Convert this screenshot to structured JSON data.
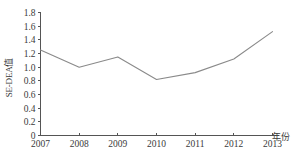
{
  "chart_data": {
    "type": "line",
    "title": "",
    "subtitle": "",
    "xlabel": "年份",
    "ylabel": "SE-DEA值",
    "x": [
      2007,
      2008,
      2009,
      2010,
      2011,
      2012,
      2013
    ],
    "categories": [
      "2007",
      "2008",
      "2009",
      "2010",
      "2011",
      "2012",
      "2013"
    ],
    "series": [
      {
        "name": "SE-DEA值",
        "values": [
          1.25,
          1.0,
          1.15,
          0.82,
          0.92,
          1.12,
          1.52
        ],
        "color": "#8a8a8a"
      }
    ],
    "xlim": [
      2007,
      2013
    ],
    "ylim": [
      0,
      1.8
    ],
    "ytick_labels": [
      "0",
      "0.2",
      "0.4",
      "0.6",
      "0.8",
      "1.0",
      "1.2",
      "1.4",
      "1.6",
      "1.8"
    ],
    "ytick_values": [
      0,
      0.2,
      0.4,
      0.6,
      0.8,
      1.0,
      1.2,
      1.4,
      1.6,
      1.8
    ],
    "xtick_labels": [
      "2007",
      "2008",
      "2009",
      "2010",
      "2011",
      "2012",
      "2013"
    ],
    "grid": false,
    "legend": false,
    "legend_position": "none"
  },
  "axes": {
    "y_title": "SE-DEA值",
    "x_title": "年份"
  }
}
